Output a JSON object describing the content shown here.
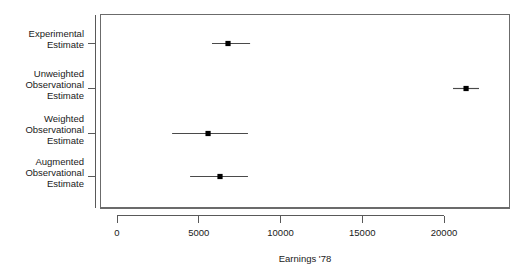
{
  "chart_data": {
    "type": "scatter",
    "subtype": "dot-and-whisker coefficient plot",
    "title": "",
    "subtitle": "",
    "xlabel": "Earnings '78",
    "ylabel": "",
    "orientation": "horizontal",
    "grid": false,
    "legend": false,
    "legend_position": "none",
    "xlim": [
      -1100,
      23900
    ],
    "xticks": [
      0,
      5000,
      10000,
      15000,
      20000
    ],
    "xticklabels": [
      "0",
      "5000",
      "10000",
      "15000",
      "20000"
    ],
    "categories": [
      "Experimental Estimate",
      "Unweighted Observational Estimate",
      "Weighted Observational Estimate",
      "Augmented Observational Estimate"
    ],
    "points": [
      {
        "label": "Experimental Estimate",
        "label_lines": [
          "Experimental",
          "Estimate"
        ],
        "estimate": 6790,
        "ci_low": 5810,
        "ci_high": 8140
      },
      {
        "label": "Unweighted Observational Estimate",
        "label_lines": [
          "Unweighted",
          "Observational",
          "Estimate"
        ],
        "estimate": 21350,
        "ci_low": 20550,
        "ci_high": 22140
      },
      {
        "label": "Weighted Observational Estimate",
        "label_lines": [
          "Weighted",
          "Observational",
          "Estimate"
        ],
        "estimate": 5570,
        "ci_low": 3370,
        "ci_high": 8010
      },
      {
        "label": "Augmented Observational Estimate",
        "label_lines": [
          "Augmented",
          "Observational",
          "Estimate"
        ],
        "estimate": 6300,
        "ci_low": 4470,
        "ci_high": 8010
      }
    ],
    "colors": {
      "point": "#000000",
      "interval": "#4a4a4a",
      "frame": "#6b6b6b",
      "text": "#1a1a1a",
      "background": "#ffffff"
    }
  },
  "axis": {
    "x_title": "Earnings '78",
    "tick_0": "0",
    "tick_5000": "5000",
    "tick_10000": "10000",
    "tick_15000": "15000",
    "tick_20000": "20000"
  },
  "ylabels": {
    "row0_line0": "Experimental",
    "row0_line1": "Estimate",
    "row1_line0": "Unweighted",
    "row1_line1": "Observational",
    "row1_line2": "Estimate",
    "row2_line0": "Weighted",
    "row2_line1": "Observational",
    "row2_line2": "Estimate",
    "row3_line0": "Augmented",
    "row3_line1": "Observational",
    "row3_line2": "Estimate"
  }
}
